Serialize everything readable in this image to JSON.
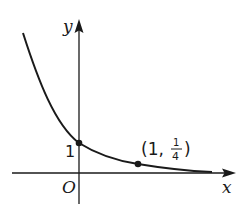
{
  "diagram": {
    "axes": {
      "x_label": "x",
      "y_label": "y",
      "origin_label": "O"
    },
    "y_intercept_label": "1",
    "points": [
      {
        "x": 0,
        "y": 1,
        "label": "1"
      },
      {
        "x": 1,
        "y": 0.25,
        "label_open": "(1,",
        "label_num": "1",
        "label_den": "4",
        "label_close": ")"
      }
    ],
    "curve": "decreasing exponential",
    "colors": {
      "stroke": "#1a1a1a",
      "background": "#ffffff"
    }
  }
}
